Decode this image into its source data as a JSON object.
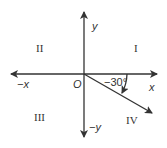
{
  "diagram": {
    "type": "coordinate-plane-angle",
    "axes": {
      "x_positive_label": "x",
      "x_negative_label": "−x",
      "y_positive_label": "y",
      "y_negative_label": "−y",
      "origin_label": "O"
    },
    "quadrants": {
      "I": "I",
      "II": "II",
      "III": "III",
      "IV": "IV"
    },
    "angle": {
      "label": "−30°",
      "value_degrees": -30,
      "direction": "clockwise"
    },
    "colors": {
      "stroke": "#333333",
      "background": "#ffffff"
    }
  }
}
